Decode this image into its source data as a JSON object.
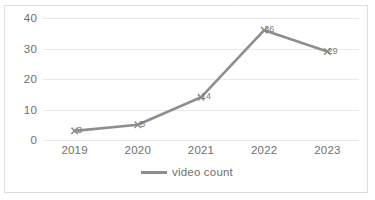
{
  "chart_data": {
    "type": "line",
    "title": "",
    "subtitle": "",
    "xlabel": "",
    "ylabel": "",
    "categories": [
      "2019",
      "2020",
      "2021",
      "2022",
      "2023"
    ],
    "series": [
      {
        "name": "video count",
        "values": [
          3,
          5,
          14,
          36,
          29
        ],
        "color": "#8e8e8d",
        "marker": "cross",
        "data_labels": [
          "3",
          "5",
          "14",
          "36",
          "29"
        ]
      }
    ],
    "ylim": [
      0,
      40
    ],
    "yticks": [
      "0",
      "10",
      "20",
      "30",
      "40"
    ],
    "ytick_values": [
      0,
      10,
      20,
      30,
      40
    ],
    "grid": "horizontal",
    "legend_position": "bottom",
    "legend_entries": [
      "video count"
    ],
    "plot_background": "#ffffff",
    "gridline_color": "#e9e9e8",
    "border_color": "#dededd",
    "axis_text_color": "#6f6f6e"
  }
}
